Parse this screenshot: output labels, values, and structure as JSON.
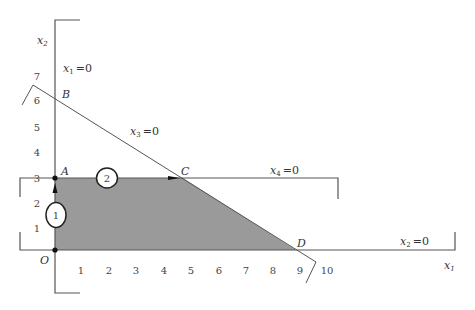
{
  "figure": {
    "type": "linear-programming feasible region diagram",
    "axes": {
      "x_label": "x",
      "x_label_sub": "1",
      "y_label": "x",
      "y_label_sub": "2",
      "origin_label": "O",
      "x_ticks": [
        "1",
        "2",
        "3",
        "4",
        "5",
        "6",
        "7",
        "8",
        "9",
        "10"
      ],
      "y_ticks": [
        "1",
        "2",
        "3",
        "4",
        "5",
        "6",
        "7"
      ]
    },
    "points": {
      "O": {
        "label": "O",
        "coords": [
          0,
          0
        ]
      },
      "A": {
        "label": "A",
        "coords": [
          0,
          3
        ]
      },
      "B": {
        "label": "B",
        "coords": [
          0,
          6
        ]
      },
      "C": {
        "label": "C",
        "coords": [
          4.7,
          3
        ]
      },
      "D": {
        "label": "D",
        "coords": [
          9,
          0
        ]
      }
    },
    "constraint_lines": [
      {
        "name": "x1",
        "var": "x",
        "sub": "1",
        "eq": "=0"
      },
      {
        "name": "x2",
        "var": "x",
        "sub": "2",
        "eq": "=0"
      },
      {
        "name": "x3",
        "var": "x",
        "sub": "3",
        "eq": "=0"
      },
      {
        "name": "x4",
        "var": "x",
        "sub": "4",
        "eq": "=0"
      }
    ],
    "steps": [
      {
        "label": "1",
        "description": "move from O to A"
      },
      {
        "label": "2",
        "description": "move from A to C"
      }
    ],
    "colors": {
      "feasible_region": "#9a9a9a",
      "lines": "#555555",
      "background": "#ffffff"
    }
  }
}
